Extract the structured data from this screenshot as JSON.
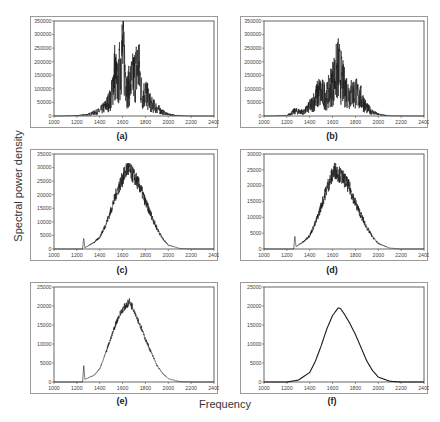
{
  "figure": {
    "ylabel": "Spectral power density",
    "xlabel": "Frequency",
    "panels": [
      {
        "id": "a",
        "label": "(a)"
      },
      {
        "id": "b",
        "label": "(b)"
      },
      {
        "id": "c",
        "label": "(c)"
      },
      {
        "id": "d",
        "label": "(d)"
      },
      {
        "id": "e",
        "label": "(e)"
      },
      {
        "id": "f",
        "label": "(f)"
      }
    ]
  },
  "chart_data": [
    {
      "type": "line",
      "panel": "(a)",
      "title": "(a)",
      "xlabel": "Frequency",
      "ylabel": "Spectral power density",
      "xlim": [
        1000,
        2400
      ],
      "ylim": [
        0,
        350000
      ],
      "xticks": [
        1000,
        1200,
        1400,
        1600,
        1800,
        2000,
        2200,
        2400
      ],
      "yticks": [
        0,
        50000,
        100000,
        150000,
        200000,
        250000,
        300000,
        350000
      ],
      "description": "Very noisy spiky spectrum, peak ~325000 near 1590",
      "x": [
        1000,
        1200,
        1300,
        1400,
        1450,
        1500,
        1530,
        1560,
        1590,
        1610,
        1640,
        1670,
        1700,
        1740,
        1770,
        1800,
        1850,
        1900,
        1950,
        2000,
        2100,
        2200,
        2400
      ],
      "y": [
        0,
        2000,
        8000,
        25000,
        50000,
        90000,
        230000,
        150000,
        325000,
        310000,
        130000,
        170000,
        200000,
        260000,
        100000,
        120000,
        60000,
        40000,
        20000,
        8000,
        2000,
        0,
        0
      ]
    },
    {
      "type": "line",
      "panel": "(b)",
      "title": "(b)",
      "xlim": [
        1000,
        2400
      ],
      "ylim": [
        0,
        350000
      ],
      "xticks": [
        1000,
        1200,
        1400,
        1600,
        1800,
        2000,
        2200,
        2400
      ],
      "yticks": [
        0,
        50000,
        100000,
        150000,
        200000,
        250000,
        300000,
        350000
      ],
      "description": "Noisy spectrum, peak ~240000 near 1650",
      "x": [
        1000,
        1200,
        1270,
        1350,
        1420,
        1480,
        1550,
        1600,
        1650,
        1700,
        1750,
        1800,
        1850,
        1900,
        1950,
        2000,
        2100,
        2400
      ],
      "y": [
        0,
        2000,
        25000,
        20000,
        60000,
        120000,
        100000,
        170000,
        240000,
        150000,
        110000,
        120000,
        90000,
        40000,
        20000,
        8000,
        1000,
        0
      ]
    },
    {
      "type": "line",
      "panel": "(c)",
      "title": "(c)",
      "xlim": [
        1000,
        2400
      ],
      "ylim": [
        0,
        35000
      ],
      "xticks": [
        1000,
        1200,
        1400,
        1600,
        1800,
        2000,
        2200,
        2400
      ],
      "yticks": [
        0,
        5000,
        10000,
        15000,
        20000,
        25000,
        30000,
        35000
      ],
      "description": "Noisy bell-shaped spectrum, peak ~31000 near 1640, spike at 1260",
      "x": [
        1000,
        1250,
        1260,
        1270,
        1350,
        1400,
        1450,
        1500,
        1550,
        1600,
        1640,
        1700,
        1750,
        1800,
        1850,
        1900,
        1950,
        2000,
        2100,
        2200,
        2400
      ],
      "y": [
        0,
        0,
        4500,
        500,
        2500,
        4500,
        9000,
        15000,
        22000,
        27000,
        31000,
        28000,
        24000,
        18000,
        13000,
        8000,
        4000,
        1500,
        200,
        0,
        0
      ]
    },
    {
      "type": "line",
      "panel": "(d)",
      "title": "(d)",
      "xlim": [
        1000,
        2400
      ],
      "ylim": [
        0,
        30000
      ],
      "xticks": [
        1000,
        1200,
        1400,
        1600,
        1800,
        2000,
        2200,
        2400
      ],
      "yticks": [
        0,
        5000,
        10000,
        15000,
        20000,
        25000,
        30000
      ],
      "description": "Bell-shaped spectrum with moderate noise, peak ~26000 near 1620, spike at 1270",
      "x": [
        1000,
        1260,
        1270,
        1280,
        1350,
        1400,
        1450,
        1500,
        1550,
        1600,
        1620,
        1700,
        1750,
        1800,
        1850,
        1900,
        1950,
        2000,
        2100,
        2200,
        2400
      ],
      "y": [
        0,
        0,
        4000,
        800,
        2500,
        4500,
        8500,
        14000,
        20000,
        24500,
        26000,
        23000,
        20000,
        15000,
        11000,
        7000,
        4000,
        1800,
        300,
        0,
        0
      ]
    },
    {
      "type": "line",
      "panel": "(e)",
      "title": "(e)",
      "xlim": [
        1000,
        2400
      ],
      "ylim": [
        0,
        25000
      ],
      "xticks": [
        1000,
        1200,
        1400,
        1600,
        1800,
        2000,
        2200,
        2400
      ],
      "yticks": [
        0,
        5000,
        10000,
        15000,
        20000,
        25000
      ],
      "description": "Smoother bell-shaped spectrum, peak ~21500 near 1660, spike at 1260",
      "x": [
        1000,
        1250,
        1260,
        1270,
        1350,
        1400,
        1450,
        1500,
        1550,
        1600,
        1660,
        1700,
        1750,
        1800,
        1850,
        1900,
        1950,
        2000,
        2100,
        2200,
        2400
      ],
      "y": [
        0,
        0,
        4500,
        700,
        1800,
        3500,
        7500,
        12000,
        16500,
        19500,
        21500,
        19500,
        15500,
        11500,
        8000,
        4500,
        2300,
        900,
        100,
        0,
        0
      ]
    },
    {
      "type": "line",
      "panel": "(f)",
      "title": "(f)",
      "xlim": [
        1000,
        2400
      ],
      "ylim": [
        0,
        25000
      ],
      "xticks": [
        1000,
        1200,
        1400,
        1600,
        1800,
        2000,
        2200,
        2400
      ],
      "yticks": [
        0,
        5000,
        10000,
        15000,
        20000,
        25000
      ],
      "description": "Smooth Gaussian-like spectrum, peak ~19500 near 1660",
      "x": [
        1000,
        1200,
        1300,
        1400,
        1450,
        1500,
        1550,
        1600,
        1650,
        1670,
        1700,
        1750,
        1800,
        1850,
        1900,
        1950,
        2000,
        2100,
        2200,
        2400
      ],
      "y": [
        0,
        0,
        500,
        2500,
        5500,
        9500,
        14000,
        17500,
        19500,
        19300,
        18000,
        15500,
        12500,
        9000,
        5500,
        3000,
        1300,
        200,
        0,
        0
      ]
    }
  ]
}
